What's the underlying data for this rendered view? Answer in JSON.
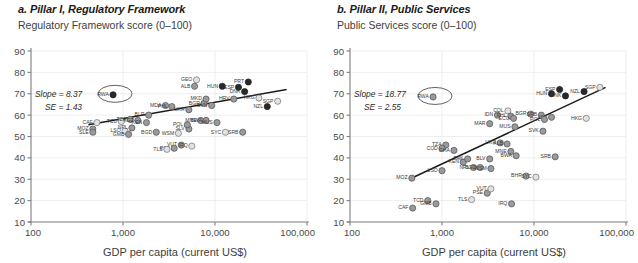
{
  "panels": [
    {
      "id": "a",
      "title": "a. Pillar I, Regulatory Framework",
      "ylabel": "Regulatory Framework score (0–100)",
      "xlabel": "GDP per capita (current US$)",
      "annotation": {
        "slope": "Slope = 8.37",
        "se": "SE = 1.43"
      },
      "highlight": "RWA"
    },
    {
      "id": "b",
      "title": "b. Pillar II, Public Services",
      "ylabel": "Public Services score (0–100)",
      "xlabel": "GDP per capita (current US$)",
      "annotation": {
        "slope": "Slope = 18.77",
        "se": "SE = 2.55"
      },
      "highlight": "RWA"
    }
  ],
  "chart_data": [
    {
      "type": "scatter",
      "panel": "a",
      "title": "a. Pillar I, Regulatory Framework",
      "xlabel": "GDP per capita (current US$)",
      "ylabel": "Regulatory Framework score (0–100)",
      "xscale": "log",
      "xlim": [
        100,
        100000
      ],
      "ylim": [
        10,
        90
      ],
      "xticks": [
        100,
        1000,
        10000,
        100000
      ],
      "xticklabels": [
        "100",
        "1,000",
        "10,000",
        "100,000"
      ],
      "yticks": [
        10,
        20,
        30,
        40,
        50,
        60,
        70,
        80,
        90
      ],
      "grid": "both",
      "legend": "none",
      "annotations": [
        "Slope = 8.37",
        "SE = 1.43"
      ],
      "trendline": {
        "x": [
          420,
          60000
        ],
        "y": [
          55.5,
          72.0
        ]
      },
      "ellipse_highlight": {
        "label": "RWA",
        "x": 780,
        "y": 69.5
      },
      "points": [
        {
          "label": "RWA",
          "x": 780,
          "y": 69.5,
          "fill": "dark"
        },
        {
          "label": "CAF",
          "x": 520,
          "y": 56.5,
          "fill": "light"
        },
        {
          "label": "TCD",
          "x": 960,
          "y": 57.0,
          "fill": "light"
        },
        {
          "label": "MOZ",
          "x": 470,
          "y": 53.5,
          "fill": "mid"
        },
        {
          "label": "SLE",
          "x": 470,
          "y": 52.0,
          "fill": "mid"
        },
        {
          "label": "LSO",
          "x": 1050,
          "y": 52.5,
          "fill": "light"
        },
        {
          "label": "GMB",
          "x": 1150,
          "y": 51.0,
          "fill": "mid"
        },
        {
          "label": "NPL",
          "x": 1250,
          "y": 54.0,
          "fill": "mid"
        },
        {
          "label": "TZA",
          "x": 1200,
          "y": 58.0,
          "fill": "mid"
        },
        {
          "label": "KGZ",
          "x": 1450,
          "y": 57.5,
          "fill": "mid"
        },
        {
          "label": "KEN",
          "x": 1800,
          "y": 56.5,
          "fill": "mid"
        },
        {
          "label": "BLR",
          "x": 1900,
          "y": 60.0,
          "fill": "mid"
        },
        {
          "label": "BGD",
          "x": 2300,
          "y": 52.0,
          "fill": "mid"
        },
        {
          "label": "MDA",
          "x": 2900,
          "y": 64.5,
          "fill": "mid"
        },
        {
          "label": "PHL",
          "x": 3400,
          "y": 64.0,
          "fill": "mid"
        },
        {
          "label": "WSM",
          "x": 4000,
          "y": 51.5,
          "fill": "light"
        },
        {
          "label": "VUT",
          "x": 4300,
          "y": 46.0,
          "fill": "mid"
        },
        {
          "label": "PSE",
          "x": 3600,
          "y": 44.5,
          "fill": "mid"
        },
        {
          "label": "TLS",
          "x": 3000,
          "y": 44.0,
          "fill": "light"
        },
        {
          "label": "IRQ",
          "x": 5600,
          "y": 45.5,
          "fill": "light"
        },
        {
          "label": "GEO",
          "x": 6300,
          "y": 76.5,
          "fill": "light"
        },
        {
          "label": "ALB",
          "x": 6000,
          "y": 73.5,
          "fill": "mid"
        },
        {
          "label": "UKR",
          "x": 5200,
          "y": 62.5,
          "fill": "mid"
        },
        {
          "label": "MNE",
          "x": 7000,
          "y": 57.5,
          "fill": "mid"
        },
        {
          "label": "BWA",
          "x": 8000,
          "y": 57.5,
          "fill": "mid"
        },
        {
          "label": "MUS",
          "x": 10500,
          "y": 56.5,
          "fill": "mid"
        },
        {
          "label": "SLV",
          "x": 5200,
          "y": 53.5,
          "fill": "mid"
        },
        {
          "label": "POL",
          "x": 5000,
          "y": 55.5,
          "fill": "mid"
        },
        {
          "label": "SYC",
          "x": 13000,
          "y": 52.0,
          "fill": "light"
        },
        {
          "label": "SRB",
          "x": 20000,
          "y": 52.0,
          "fill": "mid"
        },
        {
          "label": "HUN",
          "x": 12000,
          "y": 73.5,
          "fill": "dark"
        },
        {
          "label": "ESP",
          "x": 18000,
          "y": 73.0,
          "fill": "dark"
        },
        {
          "label": "PRT",
          "x": 23000,
          "y": 75.5,
          "fill": "dark"
        },
        {
          "label": "DNK",
          "x": 21000,
          "y": 71.0,
          "fill": "dark"
        },
        {
          "label": "HRV",
          "x": 16000,
          "y": 67.5,
          "fill": "mid"
        },
        {
          "label": "HKG",
          "x": 30000,
          "y": 68.0,
          "fill": "light"
        },
        {
          "label": "SGP",
          "x": 48000,
          "y": 66.5,
          "fill": "light"
        },
        {
          "label": "NZL",
          "x": 37000,
          "y": 64.0,
          "fill": "dark"
        },
        {
          "label": "BGR",
          "x": 7600,
          "y": 65.5,
          "fill": "mid"
        },
        {
          "label": "SVN",
          "x": 9200,
          "y": 64.5,
          "fill": "mid"
        },
        {
          "label": "MKD",
          "x": 8000,
          "y": 67.5,
          "fill": "mid"
        }
      ]
    },
    {
      "type": "scatter",
      "panel": "b",
      "title": "b. Pillar II, Public Services",
      "xlabel": "GDP per capita (current US$)",
      "ylabel": "Public Services score (0–100)",
      "xscale": "log",
      "xlim": [
        100,
        100000
      ],
      "ylim": [
        10,
        90
      ],
      "xticks": [
        100,
        1000,
        10000,
        100000
      ],
      "xticklabels": [
        "100",
        "1,000",
        "10,000",
        "100,000"
      ],
      "yticks": [
        10,
        20,
        30,
        40,
        50,
        60,
        70,
        80,
        90
      ],
      "grid": "both",
      "legend": "none",
      "annotations": [
        "Slope = 18.77",
        "SE = 2.55"
      ],
      "trendline": {
        "x": [
          440,
          60000
        ],
        "y": [
          30.0,
          73.0
        ]
      },
      "ellipse_highlight": {
        "label": "RWA",
        "x": 800,
        "y": 68.5
      },
      "points": [
        {
          "label": "RWA",
          "x": 800,
          "y": 68.5,
          "fill": "mid"
        },
        {
          "label": "CAF",
          "x": 480,
          "y": 16.5,
          "fill": "mid"
        },
        {
          "label": "TCD",
          "x": 700,
          "y": 20.0,
          "fill": "mid"
        },
        {
          "label": "GMB",
          "x": 860,
          "y": 18.5,
          "fill": "mid"
        },
        {
          "label": "MOZ",
          "x": 470,
          "y": 30.5,
          "fill": "mid"
        },
        {
          "label": "LSO",
          "x": 1000,
          "y": 34.0,
          "fill": "mid"
        },
        {
          "label": "TLS",
          "x": 2100,
          "y": 20.5,
          "fill": "light"
        },
        {
          "label": "PSE",
          "x": 3100,
          "y": 23.5,
          "fill": "mid"
        },
        {
          "label": "VUT",
          "x": 3400,
          "y": 25.5,
          "fill": "light"
        },
        {
          "label": "IRQ",
          "x": 5700,
          "y": 18.5,
          "fill": "mid"
        },
        {
          "label": "TZA",
          "x": 1100,
          "y": 46.0,
          "fill": "mid"
        },
        {
          "label": "COD",
          "x": 1000,
          "y": 44.5,
          "fill": "mid"
        },
        {
          "label": "GHA",
          "x": 1350,
          "y": 43.5,
          "fill": "mid"
        },
        {
          "label": "KEN",
          "x": 1700,
          "y": 38.0,
          "fill": "mid"
        },
        {
          "label": "PAK",
          "x": 1900,
          "y": 39.5,
          "fill": "mid"
        },
        {
          "label": "NPL",
          "x": 2200,
          "y": 35.5,
          "fill": "mid"
        },
        {
          "label": "BGD",
          "x": 2600,
          "y": 35.5,
          "fill": "mid"
        },
        {
          "label": "WSM",
          "x": 3400,
          "y": 35.0,
          "fill": "mid"
        },
        {
          "label": "BLV",
          "x": 3300,
          "y": 39.5,
          "fill": "mid"
        },
        {
          "label": "MAR",
          "x": 3300,
          "y": 56.0,
          "fill": "mid"
        },
        {
          "label": "IDN",
          "x": 4000,
          "y": 60.0,
          "fill": "mid"
        },
        {
          "label": "COL",
          "x": 5200,
          "y": 62.0,
          "fill": "light"
        },
        {
          "label": "PHL",
          "x": 5600,
          "y": 59.5,
          "fill": "mid"
        },
        {
          "label": "ECU",
          "x": 6000,
          "y": 58.5,
          "fill": "mid"
        },
        {
          "label": "UKR",
          "x": 4300,
          "y": 47.0,
          "fill": "mid"
        },
        {
          "label": "ALB",
          "x": 5100,
          "y": 46.5,
          "fill": "mid"
        },
        {
          "label": "MNE",
          "x": 5600,
          "y": 43.0,
          "fill": "mid"
        },
        {
          "label": "BWA",
          "x": 6400,
          "y": 41.0,
          "fill": "mid"
        },
        {
          "label": "MUS",
          "x": 6200,
          "y": 54.5,
          "fill": "mid"
        },
        {
          "label": "BHR",
          "x": 8200,
          "y": 31.5,
          "fill": "mid"
        },
        {
          "label": "SYC",
          "x": 10500,
          "y": 31.0,
          "fill": "light"
        },
        {
          "label": "SRB",
          "x": 17000,
          "y": 40.5,
          "fill": "mid"
        },
        {
          "label": "BGR",
          "x": 9200,
          "y": 60.5,
          "fill": "mid"
        },
        {
          "label": "SRB2",
          "x": 12000,
          "y": 60.0,
          "fill": "mid"
        },
        {
          "label": "ISR",
          "x": 15500,
          "y": 59.0,
          "fill": "mid"
        },
        {
          "label": "POL",
          "x": 13000,
          "y": 58.0,
          "fill": "mid"
        },
        {
          "label": "SVK",
          "x": 12500,
          "y": 52.5,
          "fill": "mid"
        },
        {
          "label": "HUN",
          "x": 15500,
          "y": 70.0,
          "fill": "dark"
        },
        {
          "label": "ESP",
          "x": 19000,
          "y": 72.0,
          "fill": "dark"
        },
        {
          "label": "DNK",
          "x": 22000,
          "y": 69.0,
          "fill": "dark"
        },
        {
          "label": "NZL",
          "x": 35000,
          "y": 71.0,
          "fill": "dark"
        },
        {
          "label": "SGP",
          "x": 52000,
          "y": 73.0,
          "fill": "light"
        },
        {
          "label": "HKG",
          "x": 37000,
          "y": 58.5,
          "fill": "light"
        }
      ]
    }
  ]
}
